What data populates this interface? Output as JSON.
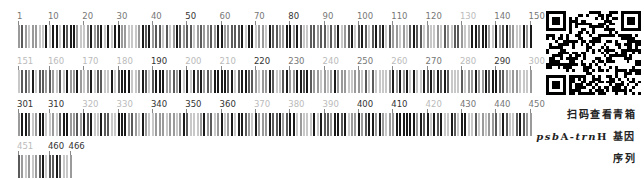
{
  "barcode": {
    "total_length": 466,
    "bases_per_row": 150,
    "rows": [
      {
        "start": 1,
        "end": 150,
        "labels": [
          {
            "text": "1",
            "pos": 1,
            "shade": "mid"
          },
          {
            "text": "10",
            "pos": 10,
            "shade": "mid"
          },
          {
            "text": "20",
            "pos": 20,
            "shade": "mid"
          },
          {
            "text": "30",
            "pos": 30,
            "shade": "mid"
          },
          {
            "text": "40",
            "pos": 40,
            "shade": "mid"
          },
          {
            "text": "50",
            "pos": 50,
            "shade": "dark"
          },
          {
            "text": "60",
            "pos": 60,
            "shade": "mid"
          },
          {
            "text": "70",
            "pos": 70,
            "shade": "mid"
          },
          {
            "text": "80",
            "pos": 80,
            "shade": "dark"
          },
          {
            "text": "90",
            "pos": 90,
            "shade": "mid"
          },
          {
            "text": "100",
            "pos": 100,
            "shade": "mid"
          },
          {
            "text": "110",
            "pos": 110,
            "shade": "mid"
          },
          {
            "text": "120",
            "pos": 120,
            "shade": "mid"
          },
          {
            "text": "130",
            "pos": 130,
            "shade": "light"
          },
          {
            "text": "140",
            "pos": 140,
            "shade": "mid"
          },
          {
            "text": "150",
            "pos": 150,
            "shade": "mid"
          }
        ]
      },
      {
        "start": 151,
        "end": 300,
        "labels": [
          {
            "text": "151",
            "pos": 151,
            "shade": "light"
          },
          {
            "text": "160",
            "pos": 160,
            "shade": "light"
          },
          {
            "text": "170",
            "pos": 170,
            "shade": "light"
          },
          {
            "text": "180",
            "pos": 180,
            "shade": "light"
          },
          {
            "text": "190",
            "pos": 190,
            "shade": "dark"
          },
          {
            "text": "200",
            "pos": 200,
            "shade": "light"
          },
          {
            "text": "210",
            "pos": 210,
            "shade": "light"
          },
          {
            "text": "220",
            "pos": 220,
            "shade": "dark"
          },
          {
            "text": "230",
            "pos": 230,
            "shade": "mid"
          },
          {
            "text": "240",
            "pos": 240,
            "shade": "light"
          },
          {
            "text": "250",
            "pos": 250,
            "shade": "mid"
          },
          {
            "text": "260",
            "pos": 260,
            "shade": "light"
          },
          {
            "text": "270",
            "pos": 270,
            "shade": "mid"
          },
          {
            "text": "280",
            "pos": 280,
            "shade": "light"
          },
          {
            "text": "290",
            "pos": 290,
            "shade": "dark"
          },
          {
            "text": "300",
            "pos": 300,
            "shade": "light"
          }
        ]
      },
      {
        "start": 301,
        "end": 450,
        "labels": [
          {
            "text": "301",
            "pos": 301,
            "shade": "dark"
          },
          {
            "text": "310",
            "pos": 310,
            "shade": "dark"
          },
          {
            "text": "320",
            "pos": 320,
            "shade": "light"
          },
          {
            "text": "330",
            "pos": 330,
            "shade": "light"
          },
          {
            "text": "340",
            "pos": 340,
            "shade": "dark"
          },
          {
            "text": "350",
            "pos": 350,
            "shade": "dark"
          },
          {
            "text": "360",
            "pos": 360,
            "shade": "dark"
          },
          {
            "text": "370",
            "pos": 370,
            "shade": "light"
          },
          {
            "text": "380",
            "pos": 380,
            "shade": "light"
          },
          {
            "text": "390",
            "pos": 390,
            "shade": "light"
          },
          {
            "text": "400",
            "pos": 400,
            "shade": "dark"
          },
          {
            "text": "410",
            "pos": 410,
            "shade": "dark"
          },
          {
            "text": "420",
            "pos": 420,
            "shade": "light"
          },
          {
            "text": "430",
            "pos": 430,
            "shade": "mid"
          },
          {
            "text": "440",
            "pos": 440,
            "shade": "mid"
          },
          {
            "text": "450",
            "pos": 450,
            "shade": "mid"
          }
        ]
      },
      {
        "start": 451,
        "end": 466,
        "labels": [
          {
            "text": "451",
            "pos": 451,
            "shade": "light"
          },
          {
            "text": "460",
            "pos": 460,
            "shade": "dark"
          },
          {
            "text": "466",
            "pos": 466,
            "shade": "dark"
          }
        ]
      }
    ],
    "colors": {
      "A": "#1a1a1a",
      "T": "#5a5a5a",
      "C": "#9a9a9a",
      "G": "#c8c8c8"
    },
    "label_colors": {
      "dark": "#333333",
      "mid": "#777777",
      "light": "#bbbbbb"
    }
  },
  "qr_code": {
    "label": "qr-code"
  },
  "caption": {
    "line1": "扫码查看青箱",
    "gene_psb": "psb",
    "gene_A": "A-",
    "gene_trn": "trn",
    "gene_H": "H",
    "line2_suffix": " 基因",
    "line3": "序列"
  }
}
